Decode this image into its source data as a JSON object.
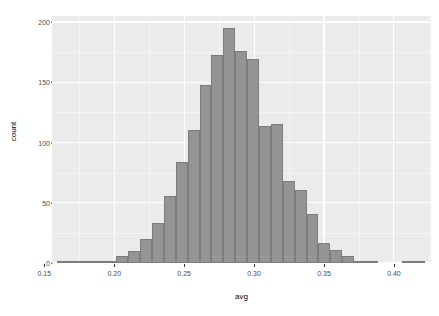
{
  "chart_data": {
    "type": "bar",
    "subtype": "histogram",
    "title": "",
    "xlabel": "avg",
    "ylabel": "count",
    "xlim": [
      0.1555,
      0.4265
    ],
    "ylim": [
      0,
      205
    ],
    "grid": true,
    "legend": false,
    "bin_width": 0.0085,
    "x_ticks": [
      "0.15",
      "0.20",
      "0.25",
      "0.30",
      "0.35",
      "0.40"
    ],
    "x_tick_values": [
      0.15,
      0.2,
      0.25,
      0.3,
      0.35,
      0.4
    ],
    "y_ticks": [
      "0",
      "50",
      "100",
      "150",
      "200"
    ],
    "y_tick_values": [
      0,
      50,
      100,
      150,
      200
    ],
    "bin_starts": [
      0.159,
      0.1675,
      0.176,
      0.1845,
      0.193,
      0.2015,
      0.21,
      0.2185,
      0.227,
      0.2355,
      0.244,
      0.2525,
      0.261,
      0.2695,
      0.278,
      0.2865,
      0.295,
      0.3035,
      0.312,
      0.3205,
      0.329,
      0.3375,
      0.346,
      0.3545,
      0.363,
      0.3715,
      0.38,
      0.3885,
      0.397,
      0.4055,
      0.414
    ],
    "categories": [
      "0.159",
      "0.168",
      "0.176",
      "0.185",
      "0.193",
      "0.202",
      "0.210",
      "0.219",
      "0.227",
      "0.236",
      "0.244",
      "0.253",
      "0.261",
      "0.270",
      "0.278",
      "0.287",
      "0.295",
      "0.304",
      "0.312",
      "0.321",
      "0.329",
      "0.338",
      "0.346",
      "0.355",
      "0.363",
      "0.372",
      "0.380",
      "0.389",
      "0.397",
      "0.406",
      "0.414"
    ],
    "values": [
      1,
      1,
      1,
      1,
      1,
      6,
      10,
      20,
      33,
      56,
      84,
      110,
      148,
      173,
      195,
      176,
      169,
      114,
      115,
      68,
      61,
      41,
      17,
      11,
      6,
      2,
      1,
      0,
      0,
      1,
      1
    ]
  },
  "style": {
    "panel_background": "#ebebeb",
    "grid_major_color": "#ffffff",
    "grid_minor_color": "#f5f5f5",
    "bar_fill": "#949494",
    "bar_border": "#7d7d7d",
    "axis_text_color": "#4d4d4d",
    "axis_title_color": "#000000",
    "plot_background": "#ffffff"
  }
}
